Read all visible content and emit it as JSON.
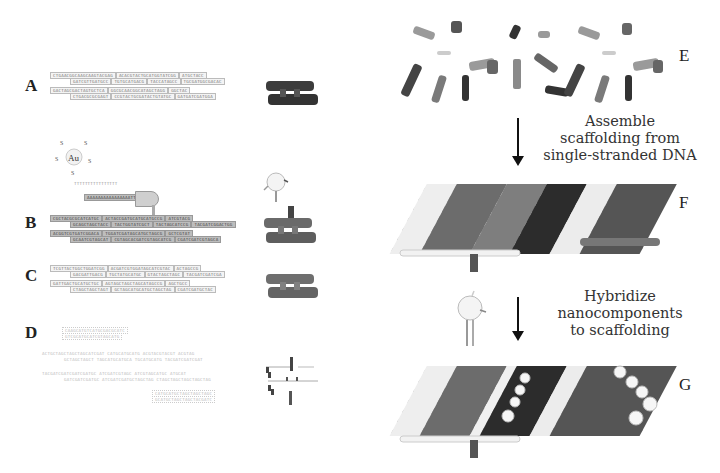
{
  "panels": {
    "A": {
      "label": "A",
      "strands": [
        [
          "CTGAACGGCAAGCAAGTACGAG",
          "ACACGTACTGCATGGTATCGG",
          "ATGCTACC"
        ],
        [
          "GATCGTTGATGCC",
          "TGTGCATGACG",
          "TACCATAGCC",
          "TGCGATGGCGACAC"
        ],
        [
          "GACTAGCGACTAGTGCTCA",
          "GGCGCAACGGCATAGCTAGG",
          "GGCTAC"
        ],
        [
          "CTGACGCGCGAGT",
          "CCGTACTGCGATACTGTATGC",
          "GATGATCGATGGA"
        ]
      ]
    },
    "B": {
      "label": "B",
      "au_label": "Au",
      "thiol_label": "S",
      "linker": "TTTTTTTTTTTTTTTT",
      "hairpin": "AAAAAAAAAAAAAAAATTG",
      "strands": [
        [
          "CGCTACGCGCATCATGC",
          "ACTACCGATGCATGCATGCCG",
          "ATCGTACG"
        ],
        [
          "GCAGCTAGCTACC",
          "TACTGGTATCGCT",
          "TACTAGCATCCG",
          "TACGATCGGACTGG"
        ],
        [
          "ACGGTCGTGATCGGACA",
          "TGGATCGATAGCATGCTAGCG",
          "GCTCGTAT"
        ],
        [
          "GCAATCGTAGCAT",
          "CGTAGCACGATCGTAGCATCG",
          "CGATCGATCGTAGCA"
        ]
      ]
    },
    "C": {
      "label": "C",
      "strands": [
        [
          "TCGTTACTGGCTGGATCGG",
          "ACGATCGTGGATAGCATCGTAC",
          "ACTAGCCG"
        ],
        [
          "GACGATTGACG",
          "TGCTATGCATGC",
          "GTACTAGCTAGC",
          "TACGATCGATCGA"
        ],
        [
          "GATTGACTGCATGCTGC",
          "AGTAGCTAGCTAGCATAGCCG",
          "AGCTGCC"
        ],
        [
          "CTAGCTAGCTAGT",
          "GCTAGCATGCATGCTAGCTAG",
          "CGATCGATGCTAC"
        ]
      ]
    },
    "D": {
      "label": "D",
      "top_probe": [
        "CAAGCATGTCATGCGACGCATC",
        "GTCGCATGCATCGTAGCATG"
      ],
      "strands": [
        [
          "ACTGCTAGCTAGCTAGCATCGAT",
          "CATGCATGCATG",
          "ACGTACGTACGT",
          "ACGTAG"
        ],
        [
          "GCTAGCTAGCT",
          "TAGCATGCATGCA",
          "TGCATGCATG",
          "TACGATCGATCGAT"
        ],
        [
          "TACGATCGATCGATCGATGC",
          "ATCGATCGTAGC",
          "ATCGTAGCATGC",
          "ATGCAT"
        ],
        [
          "GATCGATCGATGC",
          "ATCGATCGATGCTAGCTAG",
          "CTAGCTAGCTAGCTAGCTAG"
        ]
      ],
      "bottom_probe": [
        "CATGCATGCTAGCTAGCTAGC",
        "GCATGCTAGCTAGCTACGATC"
      ]
    },
    "E": {
      "label": "E"
    },
    "F": {
      "label": "F"
    },
    "G": {
      "label": "G"
    }
  },
  "steps": [
    {
      "caption_lines": [
        "Assemble",
        "scaffolding from",
        "single-stranded DNA"
      ]
    },
    {
      "caption_lines": [
        "Hybridize",
        "nanocomponents",
        "to scaffolding"
      ]
    }
  ],
  "colors": {
    "dark_tube": "#3a3a3a",
    "mid_tube": "#6e6e6e",
    "light_tube": "#e8e8e8",
    "seq_box_shaded": "#bdbdbd",
    "text": "#333333"
  }
}
